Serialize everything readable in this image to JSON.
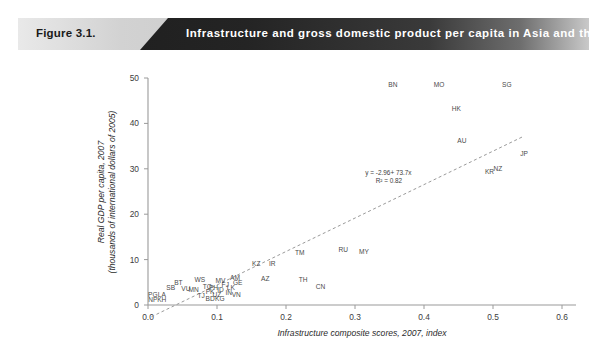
{
  "banner": {
    "figure_number": "Figure 3.1.",
    "title": "Infrastructure and gross domestic product per capita in Asia and the Pacific, 2007",
    "label_color": "#1a1a1a",
    "title_color": "#ffffff",
    "band_color": "#1c1c1c",
    "background_color": "#d2d2d2"
  },
  "chart_data": {
    "type": "scatter",
    "title": "Infrastructure and gross domestic product per capita in Asia and the Pacific, 2007",
    "xlabel": "Infrastructure composite scores, 2007, index",
    "ylabel": "Real GDP per capita, 2007 (thousands of international dollars of 2005)",
    "ylabel_line1": "Real GDP per capita, 2007",
    "ylabel_line2": "(thousands of international dollars of 2005)",
    "xlim": [
      0.0,
      0.6
    ],
    "ylim": [
      0,
      50
    ],
    "xticks": [
      "0.0",
      "0.1",
      "0.2",
      "0.3",
      "0.4",
      "0.5",
      "0.6"
    ],
    "xtick_values": [
      0.0,
      0.1,
      0.2,
      0.3,
      0.4,
      0.5,
      0.6
    ],
    "yticks": [
      "0",
      "10",
      "20",
      "30",
      "40",
      "50"
    ],
    "ytick_values": [
      0,
      10,
      20,
      30,
      40,
      50
    ],
    "grid": false,
    "legend": "none",
    "marker_style": "text-label-only",
    "annotations": [
      {
        "text": "y = -2.96+ 73.7x",
        "x": 0.315,
        "y": 28.6
      },
      {
        "text": "R² = 0.82",
        "x": 0.33,
        "y": 26.9
      }
    ],
    "trendline": {
      "type": "linear",
      "equation": "y = -2.96 + 73.7x",
      "r_squared": 0.82,
      "intercept": -2.96,
      "slope": 73.7,
      "style": "dashed",
      "color": "#9a9a9a"
    },
    "points": [
      {
        "label": "PG",
        "x": 0.007,
        "y": 1.8
      },
      {
        "label": "LA",
        "x": 0.02,
        "y": 1.8
      },
      {
        "label": "NP",
        "x": 0.007,
        "y": 0.7
      },
      {
        "label": "KH",
        "x": 0.02,
        "y": 0.7
      },
      {
        "label": "SB",
        "x": 0.033,
        "y": 3.3
      },
      {
        "label": "BT",
        "x": 0.044,
        "y": 4.4
      },
      {
        "label": "VU",
        "x": 0.055,
        "y": 3.1
      },
      {
        "label": "MN",
        "x": 0.066,
        "y": 2.9
      },
      {
        "label": "TJ",
        "x": 0.077,
        "y": 1.6
      },
      {
        "label": "BD",
        "x": 0.09,
        "y": 0.8
      },
      {
        "label": "KG",
        "x": 0.104,
        "y": 0.8
      },
      {
        "label": "UZ",
        "x": 0.1,
        "y": 1.7
      },
      {
        "label": "WS",
        "x": 0.075,
        "y": 5.0
      },
      {
        "label": "TO",
        "x": 0.086,
        "y": 3.6
      },
      {
        "label": "PH",
        "x": 0.095,
        "y": 3.3
      },
      {
        "label": "PK",
        "x": 0.09,
        "y": 2.5
      },
      {
        "label": "ID",
        "x": 0.105,
        "y": 2.9
      },
      {
        "label": "IN",
        "x": 0.117,
        "y": 2.2
      },
      {
        "label": "VN",
        "x": 0.128,
        "y": 1.7
      },
      {
        "label": "MV",
        "x": 0.105,
        "y": 4.9
      },
      {
        "label": "FJ",
        "x": 0.112,
        "y": 3.9
      },
      {
        "label": "LK",
        "x": 0.12,
        "y": 3.3
      },
      {
        "label": "AM",
        "x": 0.126,
        "y": 5.4
      },
      {
        "label": "GE",
        "x": 0.13,
        "y": 4.3
      },
      {
        "label": "KZ",
        "x": 0.157,
        "y": 8.5
      },
      {
        "label": "IR",
        "x": 0.18,
        "y": 8.6
      },
      {
        "label": "AZ",
        "x": 0.17,
        "y": 5.2
      },
      {
        "label": "TM",
        "x": 0.22,
        "y": 11.1
      },
      {
        "label": "TH",
        "x": 0.225,
        "y": 5.1
      },
      {
        "label": "CN",
        "x": 0.25,
        "y": 3.6
      },
      {
        "label": "RU",
        "x": 0.283,
        "y": 11.7
      },
      {
        "label": "MY",
        "x": 0.313,
        "y": 11.3
      },
      {
        "label": "BN",
        "x": 0.355,
        "y": 48.0
      },
      {
        "label": "MO",
        "x": 0.422,
        "y": 48.0
      },
      {
        "label": "SG",
        "x": 0.52,
        "y": 48.0
      },
      {
        "label": "HK",
        "x": 0.447,
        "y": 42.7
      },
      {
        "label": "AU",
        "x": 0.455,
        "y": 35.6
      },
      {
        "label": "JP",
        "x": 0.545,
        "y": 32.8
      },
      {
        "label": "KR",
        "x": 0.495,
        "y": 28.8
      },
      {
        "label": "NZ",
        "x": 0.507,
        "y": 29.6
      }
    ]
  }
}
